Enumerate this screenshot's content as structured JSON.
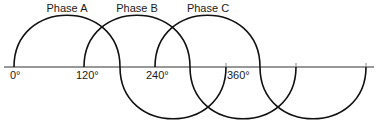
{
  "diagram": {
    "phases": [
      {
        "name": "Phase A",
        "start_deg": 0,
        "label_x": 67
      },
      {
        "name": "Phase B",
        "start_deg": 120,
        "label_x": 138
      },
      {
        "name": "Phase C",
        "start_deg": 240,
        "label_x": 210
      }
    ],
    "axis_labels": [
      {
        "text": "0°",
        "x": 10
      },
      {
        "text": "120°",
        "x": 76
      },
      {
        "text": "240°",
        "x": 146
      },
      {
        "text": "360°",
        "x": 228
      }
    ],
    "colors": {
      "line": "#111111",
      "axis": "#333333",
      "background": "#ffffff"
    }
  }
}
